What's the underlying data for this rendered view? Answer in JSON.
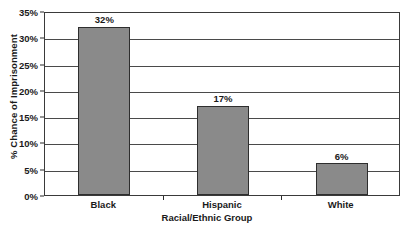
{
  "chart_data": {
    "type": "bar",
    "title": "",
    "categories": [
      "Black",
      "Hispanic",
      "White"
    ],
    "values": [
      32,
      17,
      6
    ],
    "value_labels": [
      "32%",
      "17%",
      "6%"
    ],
    "xlabel": "Racial/Ethnic Group",
    "ylabel": "% Chance of Imprisonment",
    "ylim": [
      0,
      35
    ],
    "ytick_values": [
      0,
      5,
      10,
      15,
      20,
      25,
      30,
      35
    ],
    "ytick_labels": [
      "0%",
      "5%",
      "10%",
      "15%",
      "20%",
      "25%",
      "30%",
      "35%"
    ],
    "grid": true,
    "grid_axis": "y",
    "legend": false,
    "legend_position": "none",
    "series": [
      {
        "name": "Chance of Imprisonment",
        "values": [
          32,
          17,
          6
        ]
      }
    ],
    "colors": {
      "bar_fill": "#8a8a8a",
      "bar_stroke": "#2e2e2e",
      "gridline": "#4a4a4a",
      "axis": "#3a3a3a",
      "text": "#1a1a1a",
      "background": "#ffffff"
    }
  }
}
